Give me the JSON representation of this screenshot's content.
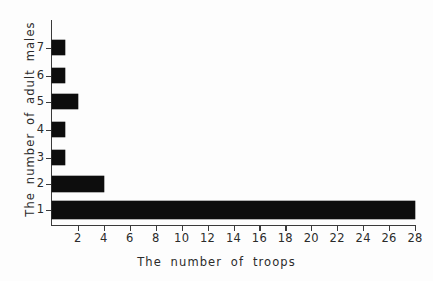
{
  "chart_data": {
    "type": "bar",
    "orientation": "horizontal",
    "title": "",
    "xlabel": "The  number   of   troops",
    "ylabel": "The  number  of  adult  males",
    "categories": [
      "7",
      "6",
      "5",
      "4",
      "3",
      "2",
      "1"
    ],
    "values": [
      1,
      1,
      2,
      1,
      1,
      4,
      28
    ],
    "xlim": [
      0,
      28
    ],
    "ylim": [
      0.5,
      7.5
    ],
    "xticks": [
      2,
      4,
      6,
      8,
      10,
      12,
      14,
      16,
      18,
      20,
      22,
      24,
      26,
      28
    ],
    "xtick_labels": [
      "2",
      "4",
      "6",
      "8",
      "10",
      "12",
      "14",
      "16",
      "18",
      "20",
      "22",
      "24",
      "26",
      "28"
    ],
    "ytick_labels": [
      "7",
      "6",
      "5",
      "4",
      "3",
      "2",
      "1"
    ],
    "grid": false,
    "legend": false,
    "bar_color": "#0d0d0d",
    "axis_color": "#3a3a3a",
    "background": "#ffffff",
    "series": [
      {
        "name": "Number of troops",
        "points": [
          {
            "category": "7",
            "value": 1
          },
          {
            "category": "6",
            "value": 1
          },
          {
            "category": "5",
            "value": 2
          },
          {
            "category": "4",
            "value": 1
          },
          {
            "category": "3",
            "value": 1
          },
          {
            "category": "2",
            "value": 4
          },
          {
            "category": "1",
            "value": 28
          }
        ]
      }
    ]
  },
  "layout": {
    "rows": [
      {
        "category": "7",
        "value": 1,
        "top": 40,
        "height": 15
      },
      {
        "category": "6",
        "value": 1,
        "top": 68,
        "height": 15
      },
      {
        "category": "5",
        "value": 2,
        "top": 94,
        "height": 15
      },
      {
        "category": "4",
        "value": 1,
        "top": 122,
        "height": 15
      },
      {
        "category": "3",
        "value": 1,
        "top": 150,
        "height": 15
      },
      {
        "category": "2",
        "value": 4,
        "top": 176,
        "height": 16
      },
      {
        "category": "1",
        "value": 28,
        "top": 201,
        "height": 18
      }
    ]
  }
}
